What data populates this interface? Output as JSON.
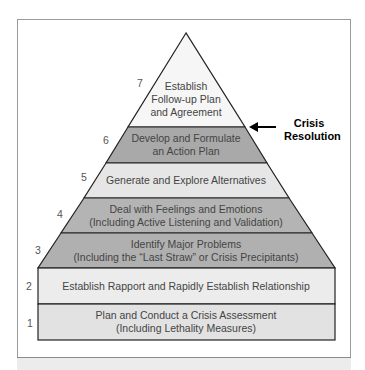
{
  "diagram": {
    "type": "pyramid",
    "levels": [
      {
        "number": "1",
        "line1": "Plan and Conduct a Crisis Assessment",
        "line2": "(Including Lethality Measures)",
        "fill": "#e3e3e3"
      },
      {
        "number": "2",
        "line1": "Establish Rapport and Rapidly Establish Relationship",
        "line2": "",
        "fill": "#ececec"
      },
      {
        "number": "3",
        "line1": "Identify Major Problems",
        "line2": "(Including the “Last Straw” or Crisis Precipitants)",
        "fill": "#b2b2b2"
      },
      {
        "number": "4",
        "line1": "Deal with Feelings and Emotions",
        "line2": "(Including Active Listening and Validation)",
        "fill": "#b2b2b2"
      },
      {
        "number": "5",
        "line1": "Generate and Explore Alternatives",
        "line2": "",
        "fill": "#e6e6e6"
      },
      {
        "number": "6",
        "line1": "Develop and Formulate",
        "line2": "an Action Plan",
        "fill": "#a9a9a9"
      },
      {
        "number": "7",
        "line1": "Establish",
        "line2": "Follow-up Plan",
        "line3": "and Agreement",
        "fill": "#f6f6f6"
      }
    ],
    "annotation": {
      "line1": "Crisis",
      "line2": "Resolution",
      "arrow": "arrow-left-icon"
    }
  }
}
